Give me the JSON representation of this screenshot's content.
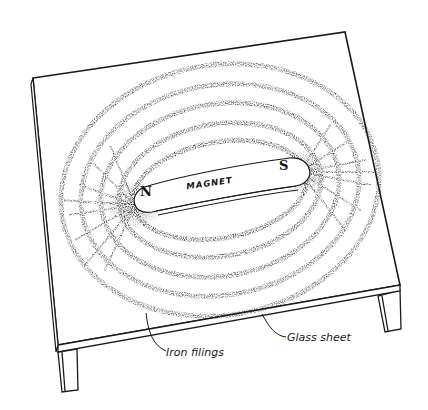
{
  "figure": {
    "magnet": {
      "label": "MAGNET",
      "north_pole_label": "N",
      "south_pole_label": "S"
    },
    "callouts": [
      {
        "id": "iron-filings",
        "text": "Iron filings"
      },
      {
        "id": "glass-sheet",
        "text": "Glass sheet"
      }
    ],
    "colors": {
      "ink": "#1a1a1a",
      "background": "#ffffff"
    }
  }
}
